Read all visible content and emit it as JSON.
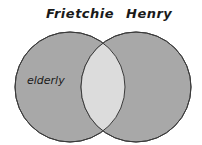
{
  "diagram": {
    "type": "venn",
    "sets": [
      {
        "name": "Frietchie",
        "region_label": "elderly"
      },
      {
        "name": "Henry",
        "region_label": ""
      }
    ],
    "intersection_label": "",
    "colors": {
      "circle_fill": "#a8a8a8",
      "intersection_fill": "#dcdcdc",
      "outline": "#3a3a3a"
    }
  }
}
